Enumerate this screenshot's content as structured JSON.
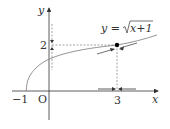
{
  "figure": {
    "function_label": "y = √(x+1)",
    "label_y_prefix": "y = ",
    "label_sqrt_arg": "x+1",
    "x_axis_label": "x",
    "y_axis_label": "y",
    "origin_label": "O",
    "x_tick_neg1": "−1",
    "x_tick_3": "3",
    "y_tick_2": "2",
    "point": {
      "x": 3,
      "y": 2
    },
    "colors": {
      "axis": "#333333",
      "curve": "#777777",
      "dashed": "#555555",
      "point": "#000000"
    }
  }
}
